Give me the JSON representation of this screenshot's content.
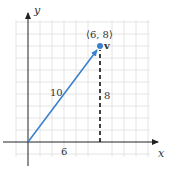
{
  "diagram": {
    "title": "",
    "axes": {
      "x_label": "x",
      "y_label": "y"
    },
    "grid": {
      "x_range": [
        -2,
        10
      ],
      "y_range": [
        -1,
        10
      ],
      "step": 1,
      "color": "#e2e2e2"
    },
    "vector": {
      "name": "v",
      "from": [
        0,
        0
      ],
      "to": [
        6,
        8
      ],
      "point_label": "⟨6, 8⟩",
      "magnitude_label": "10",
      "color": "#3a7fd0"
    },
    "components": {
      "horizontal_label": "6",
      "vertical_label": "8",
      "vertical_style": "dashed",
      "color": "#111111"
    }
  }
}
